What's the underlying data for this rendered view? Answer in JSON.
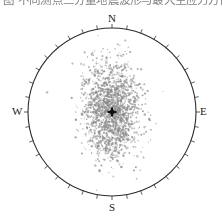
{
  "figure": {
    "caption_clipped": "图  不同测点三分量地震波形与最大主应力方向对比分析",
    "title": "",
    "plot_type": "polar-scatter"
  },
  "compass": {
    "north_label": "N",
    "east_label": "E",
    "south_label": "S",
    "west_label": "W"
  },
  "colors": {
    "circle_stroke": "#2b2b2b",
    "tick_stroke": "#4a4a4a",
    "point_fill": "#8d8d8d",
    "center_marker": "#111111",
    "background": "#ffffff",
    "label_text": "#222222"
  },
  "geometry": {
    "center_x": 112,
    "center_y": 112,
    "radius": 84,
    "tick_step_degrees": 10,
    "tick_length": 4
  },
  "chart_data": {
    "type": "scatter",
    "title": "",
    "xlabel": "",
    "ylabel": "",
    "projection": "polar-equal-area",
    "grid": false,
    "legend": null,
    "axis_labels": [
      "N",
      "E",
      "S",
      "W"
    ],
    "axis_angles_degrees": [
      0,
      90,
      180,
      270
    ],
    "xlim": [
      -1,
      1
    ],
    "ylim": [
      -1,
      1
    ],
    "center_marker": {
      "x": 0.0,
      "y": 0.0,
      "symbol": "plus",
      "label": "mean-direction"
    },
    "cloud": {
      "n_points": 1800,
      "center": {
        "x": -0.005,
        "y": 0.02
      },
      "sigma_x": 0.16,
      "sigma_y": 0.28,
      "elongation_axis": "north-south"
    },
    "outliers": [
      {
        "x": -0.3,
        "y": 0.02
      },
      {
        "x": 0.27,
        "y": 0.04
      },
      {
        "x": 0.24,
        "y": -0.11
      },
      {
        "x": 0.21,
        "y": 0.21
      },
      {
        "x": -0.21,
        "y": -0.25
      },
      {
        "x": 0.1,
        "y": 0.36
      },
      {
        "x": -0.06,
        "y": -0.41
      },
      {
        "x": 0.18,
        "y": -0.3
      }
    ]
  }
}
